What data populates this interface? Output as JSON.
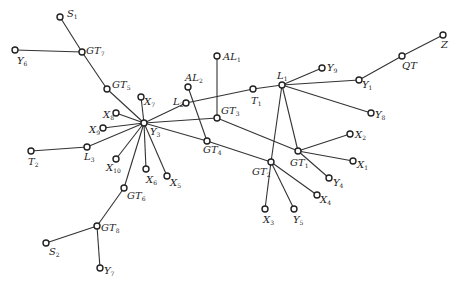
{
  "diagram": {
    "type": "network-graph",
    "nodes": [
      {
        "id": "S1",
        "base": "S",
        "sub": "1",
        "x": 60,
        "y": 17,
        "lx": 67,
        "ly": 9
      },
      {
        "id": "GT7",
        "base": "GT",
        "sub": "7",
        "x": 82,
        "y": 52,
        "lx": 86,
        "ly": 46
      },
      {
        "id": "Y6",
        "base": "Y",
        "sub": "6",
        "x": 15,
        "y": 50,
        "lx": 17,
        "ly": 56
      },
      {
        "id": "GT5",
        "base": "GT",
        "sub": "5",
        "x": 107,
        "y": 89,
        "lx": 112,
        "ly": 80
      },
      {
        "id": "X7",
        "base": "X",
        "sub": "7",
        "x": 141,
        "y": 97,
        "lx": 144,
        "ly": 97
      },
      {
        "id": "X8",
        "base": "X",
        "sub": "8",
        "x": 116,
        "y": 113,
        "lx": 103,
        "ly": 110
      },
      {
        "id": "Y3",
        "base": "Y",
        "sub": "3",
        "x": 144,
        "y": 123,
        "lx": 150,
        "ly": 127
      },
      {
        "id": "X9",
        "base": "X",
        "sub": "9",
        "x": 103,
        "y": 128,
        "lx": 89,
        "ly": 125
      },
      {
        "id": "L3",
        "base": "L",
        "sub": "3",
        "x": 87,
        "y": 147,
        "lx": 84,
        "ly": 152
      },
      {
        "id": "T2",
        "base": "T",
        "sub": "2",
        "x": 31,
        "y": 151,
        "lx": 28,
        "ly": 157
      },
      {
        "id": "X10",
        "base": "X",
        "sub": "10",
        "x": 116,
        "y": 159,
        "lx": 106,
        "ly": 163
      },
      {
        "id": "X6",
        "base": "X",
        "sub": "6",
        "x": 146,
        "y": 169,
        "lx": 146,
        "ly": 175
      },
      {
        "id": "X5",
        "base": "X",
        "sub": "5",
        "x": 167,
        "y": 176,
        "lx": 170,
        "ly": 178
      },
      {
        "id": "GT6",
        "base": "GT",
        "sub": "6",
        "x": 124,
        "y": 188,
        "lx": 127,
        "ly": 191
      },
      {
        "id": "GT8",
        "base": "GT",
        "sub": "8",
        "x": 97,
        "y": 226,
        "lx": 101,
        "ly": 223
      },
      {
        "id": "S2",
        "base": "S",
        "sub": "2",
        "x": 46,
        "y": 243,
        "lx": 49,
        "ly": 247
      },
      {
        "id": "Y7",
        "base": "Y",
        "sub": "7",
        "x": 100,
        "y": 268,
        "lx": 104,
        "ly": 266
      },
      {
        "id": "AL2",
        "base": "AL",
        "sub": "2",
        "x": 188,
        "y": 87,
        "lx": 185,
        "ly": 73
      },
      {
        "id": "L2",
        "base": "L",
        "sub": "2",
        "x": 186,
        "y": 103,
        "lx": 173,
        "ly": 97
      },
      {
        "id": "AL1",
        "base": "AL",
        "sub": "1",
        "x": 217,
        "y": 56,
        "lx": 223,
        "ly": 52
      },
      {
        "id": "GT3",
        "base": "GT",
        "sub": "3",
        "x": 217,
        "y": 118,
        "lx": 221,
        "ly": 106
      },
      {
        "id": "GT4",
        "base": "GT",
        "sub": "4",
        "x": 207,
        "y": 141,
        "lx": 203,
        "ly": 145
      },
      {
        "id": "T1",
        "base": "T",
        "sub": "1",
        "x": 253,
        "y": 89,
        "lx": 251,
        "ly": 96
      },
      {
        "id": "L1",
        "base": "L",
        "sub": "1",
        "x": 282,
        "y": 85,
        "lx": 277,
        "ly": 71
      },
      {
        "id": "Y9",
        "base": "Y",
        "sub": "9",
        "x": 322,
        "y": 68,
        "lx": 327,
        "ly": 63
      },
      {
        "id": "Y1",
        "base": "Y",
        "sub": "1",
        "x": 359,
        "y": 80,
        "lx": 362,
        "ly": 80
      },
      {
        "id": "QT",
        "base": "QT",
        "sub": "",
        "x": 402,
        "y": 56,
        "lx": 402,
        "ly": 61
      },
      {
        "id": "Z",
        "base": "Z",
        "sub": "",
        "x": 443,
        "y": 35,
        "lx": 441,
        "ly": 40
      },
      {
        "id": "Y8",
        "base": "Y",
        "sub": "8",
        "x": 371,
        "y": 113,
        "lx": 375,
        "ly": 110
      },
      {
        "id": "GT1",
        "base": "GT",
        "sub": "1",
        "x": 298,
        "y": 151,
        "lx": 290,
        "ly": 158
      },
      {
        "id": "X2",
        "base": "X",
        "sub": "2",
        "x": 350,
        "y": 134,
        "lx": 355,
        "ly": 130
      },
      {
        "id": "X1",
        "base": "X",
        "sub": "1",
        "x": 353,
        "y": 161,
        "lx": 357,
        "ly": 160
      },
      {
        "id": "Y4",
        "base": "Y",
        "sub": "4",
        "x": 329,
        "y": 178,
        "lx": 333,
        "ly": 178
      },
      {
        "id": "GT2",
        "base": "GT",
        "sub": "2",
        "x": 271,
        "y": 162,
        "lx": 252,
        "ly": 167
      },
      {
        "id": "X4",
        "base": "X",
        "sub": "4",
        "x": 317,
        "y": 195,
        "lx": 320,
        "ly": 195
      },
      {
        "id": "X3",
        "base": "X",
        "sub": "3",
        "x": 265,
        "y": 209,
        "lx": 263,
        "ly": 215
      },
      {
        "id": "Y5",
        "base": "Y",
        "sub": "5",
        "x": 294,
        "y": 209,
        "lx": 293,
        "ly": 215
      }
    ],
    "edges": [
      [
        "S1",
        "GT7"
      ],
      [
        "Y6",
        "GT7"
      ],
      [
        "GT7",
        "GT5"
      ],
      [
        "GT5",
        "Y3"
      ],
      [
        "X7",
        "Y3"
      ],
      [
        "X8",
        "Y3"
      ],
      [
        "X9",
        "Y3"
      ],
      [
        "L3",
        "Y3"
      ],
      [
        "T2",
        "L3"
      ],
      [
        "X10",
        "Y3"
      ],
      [
        "X6",
        "Y3"
      ],
      [
        "X5",
        "Y3"
      ],
      [
        "GT6",
        "Y3"
      ],
      [
        "GT6",
        "GT8"
      ],
      [
        "GT8",
        "S2"
      ],
      [
        "GT8",
        "Y7"
      ],
      [
        "Y3",
        "L2"
      ],
      [
        "L2",
        "T1"
      ],
      [
        "T1",
        "L1"
      ],
      [
        "AL2",
        "GT4"
      ],
      [
        "AL1",
        "GT3"
      ],
      [
        "Y3",
        "GT3"
      ],
      [
        "GT3",
        "GT1"
      ],
      [
        "Y3",
        "GT4"
      ],
      [
        "GT4",
        "GT2"
      ],
      [
        "L1",
        "Y9"
      ],
      [
        "L1",
        "Y1"
      ],
      [
        "Y1",
        "QT"
      ],
      [
        "QT",
        "Z"
      ],
      [
        "L1",
        "Y8"
      ],
      [
        "L1",
        "GT1"
      ],
      [
        "L1",
        "GT2"
      ],
      [
        "GT1",
        "X2"
      ],
      [
        "GT1",
        "X1"
      ],
      [
        "GT1",
        "Y4"
      ],
      [
        "GT2",
        "X4"
      ],
      [
        "GT2",
        "X3"
      ],
      [
        "GT2",
        "Y5"
      ]
    ]
  }
}
